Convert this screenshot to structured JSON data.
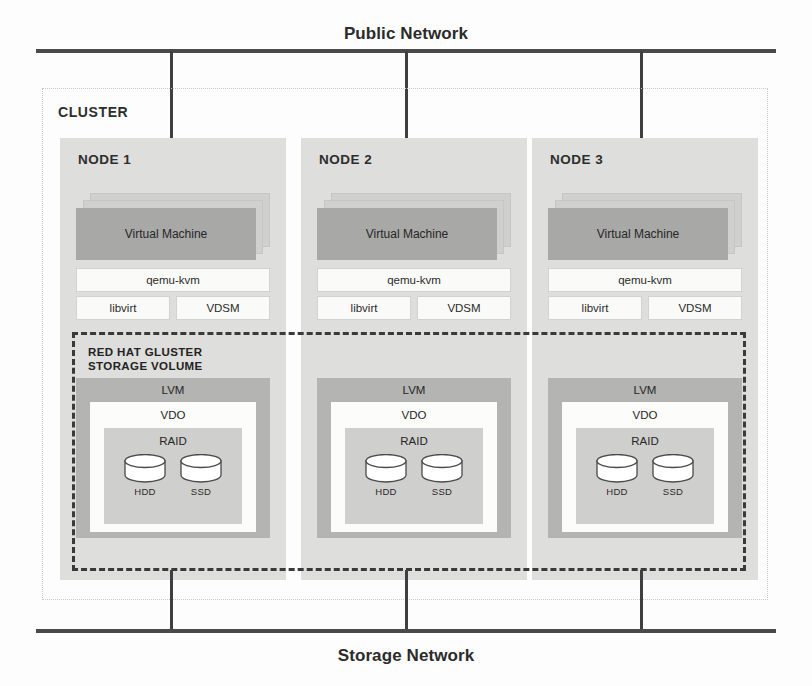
{
  "networks": {
    "public": {
      "label": "Public Network"
    },
    "storage": {
      "label": "Storage Network"
    }
  },
  "cluster": {
    "label": "CLUSTER",
    "gluster_volume": {
      "label": "RED HAT GLUSTER\nSTORAGE VOLUME"
    },
    "nodes": [
      {
        "label": "NODE 1",
        "vm": {
          "label": "Virtual Machine"
        },
        "software": [
          {
            "label": "qemu-kvm"
          },
          {
            "label": "libvirt"
          },
          {
            "label": "VDSM"
          }
        ],
        "storage": {
          "lvm": "LVM",
          "vdo": "VDO",
          "raid": "RAID",
          "disks": [
            {
              "label": "HDD"
            },
            {
              "label": "SSD"
            }
          ]
        }
      },
      {
        "label": "NODE 2",
        "vm": {
          "label": "Virtual Machine"
        },
        "software": [
          {
            "label": "qemu-kvm"
          },
          {
            "label": "libvirt"
          },
          {
            "label": "VDSM"
          }
        ],
        "storage": {
          "lvm": "LVM",
          "vdo": "VDO",
          "raid": "RAID",
          "disks": [
            {
              "label": "HDD"
            },
            {
              "label": "SSD"
            }
          ]
        }
      },
      {
        "label": "NODE 3",
        "vm": {
          "label": "Virtual Machine"
        },
        "software": [
          {
            "label": "qemu-kvm"
          },
          {
            "label": "libvirt"
          },
          {
            "label": "VDSM"
          }
        ],
        "storage": {
          "lvm": "LVM",
          "vdo": "VDO",
          "raid": "RAID",
          "disks": [
            {
              "label": "HDD"
            },
            {
              "label": "SSD"
            }
          ]
        }
      }
    ]
  },
  "colors": {
    "node_bg": "#dededc",
    "vm_fill": "#a8a8a6",
    "lvm_fill": "#b4b4b2",
    "vdo_fill": "#fcfcfb",
    "raid_fill": "#cfcfcd",
    "network_bar": "#4a4a4a",
    "gluster_border": "#3a3a3a"
  }
}
